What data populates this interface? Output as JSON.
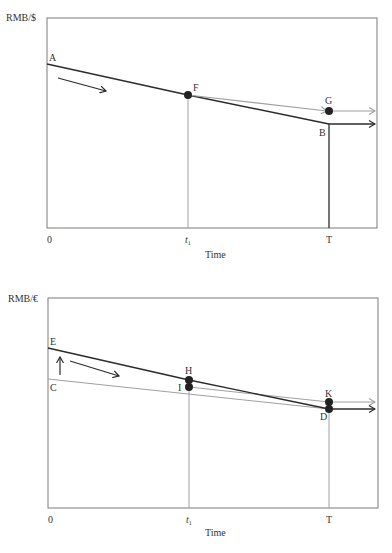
{
  "diagrams": [
    {
      "id": "top",
      "y_axis_label": "RMB/$",
      "x_axis_label": "Time",
      "x_ticks": [
        "0",
        "t",
        "T"
      ],
      "t_subscript": "1",
      "points": {
        "A": "A",
        "F": "F",
        "G": "G",
        "B": "B"
      },
      "colors": {
        "dark": "#2b2b2b",
        "gray": "#a0a0a0",
        "frame": "#7a7a7a"
      }
    },
    {
      "id": "bottom",
      "y_axis_label": "RMB/€",
      "x_axis_label": "Time",
      "x_ticks": [
        "0",
        "t",
        "T"
      ],
      "t_subscript": "1",
      "points": {
        "E": "E",
        "C": "C",
        "H": "H",
        "I": "I",
        "K": "K",
        "D": "D"
      },
      "colors": {
        "dark": "#2b2b2b",
        "gray": "#a0a0a0",
        "frame": "#7a7a7a"
      }
    }
  ]
}
